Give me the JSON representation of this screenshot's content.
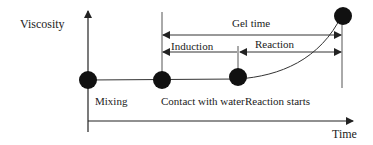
{
  "diagram": {
    "y_axis_label": "Viscosity",
    "x_axis_label": "Time",
    "events": [
      {
        "label": "Mixing"
      },
      {
        "label": "Contact with water"
      },
      {
        "label": "Reaction starts"
      },
      {
        "label": "Gel"
      }
    ],
    "intervals": {
      "gel_time": "Gel time",
      "induction": "Induction",
      "reaction": "Reaction"
    },
    "colors": {
      "line": "#333333",
      "dot": "#111111",
      "text": "#222222",
      "background": "#ffffff"
    }
  }
}
